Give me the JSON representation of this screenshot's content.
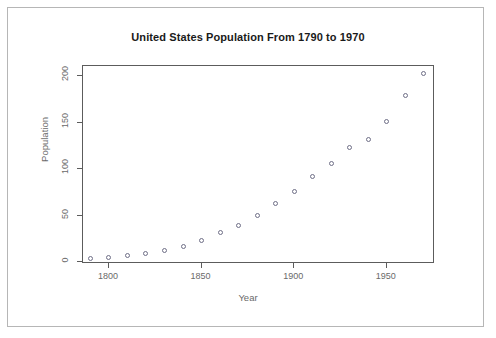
{
  "chart_data": {
    "type": "scatter",
    "title": "United States Population From 1790 to 1970",
    "xlabel": "Year",
    "ylabel": "Population",
    "xlim": [
      1786,
      1976
    ],
    "ylim": [
      -2,
      211
    ],
    "grid": false,
    "legend": false,
    "marker": "open-circle",
    "marker_color": "#6e6e86",
    "xticks": [
      1800,
      1850,
      1900,
      1950
    ],
    "xticklabels": [
      "1800",
      "1850",
      "1900",
      "1950"
    ],
    "yticks": [
      0,
      50,
      100,
      150,
      200
    ],
    "yticklabels": [
      "0",
      "50",
      "100",
      "150",
      "200"
    ],
    "x": [
      1790,
      1800,
      1810,
      1820,
      1830,
      1840,
      1850,
      1860,
      1870,
      1880,
      1890,
      1900,
      1910,
      1920,
      1930,
      1940,
      1950,
      1960,
      1970
    ],
    "values": [
      3.93,
      5.31,
      7.24,
      9.64,
      12.9,
      17.1,
      23.2,
      31.4,
      39.8,
      50.2,
      62.9,
      76.0,
      92.0,
      105.7,
      122.8,
      131.7,
      151.3,
      179.3,
      203.2
    ]
  },
  "colors": {
    "title": "#1a1a1a",
    "axis_text": "#6a6a6a",
    "axis_line": "#5c5c5c",
    "page_border": "#b6b6b6",
    "background": "#ffffff"
  }
}
